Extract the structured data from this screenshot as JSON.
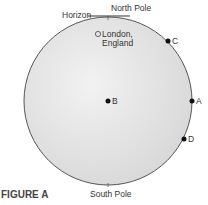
{
  "figure": {
    "caption": "FIGURE A",
    "labels": {
      "horizon": "Horizon",
      "north_pole": "North Pole",
      "south_pole": "South Pole",
      "london_line1": "London,",
      "london_line2": "England"
    },
    "points": [
      {
        "id": "A",
        "label": "A"
      },
      {
        "id": "B",
        "label": "B"
      },
      {
        "id": "C",
        "label": "C"
      },
      {
        "id": "D",
        "label": "D"
      }
    ]
  },
  "colors": {
    "globe_fill": "#e6e6e6",
    "outline": "#555555"
  }
}
